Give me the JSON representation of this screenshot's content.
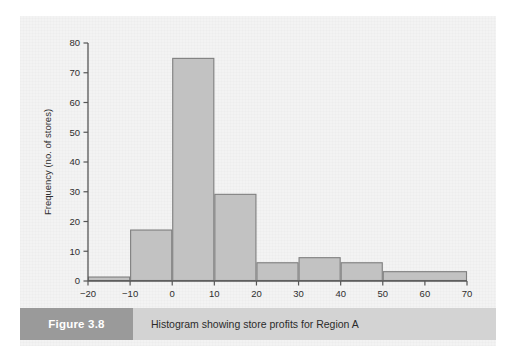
{
  "figure": {
    "tag": "Figure 3.8",
    "caption": "Histogram showing store profits for Region A"
  },
  "colors": {
    "bar_fill": "#c2c2c2",
    "bar_stroke": "#7e7e7e",
    "axis": "#555555",
    "panel_bg": "#f3f3f3",
    "caption_bar": "#d3d3d3",
    "figure_tag_bg": "#9a9a9a",
    "figure_tag_text": "#ffffff",
    "text": "#2e2e2e"
  },
  "chart_data": {
    "type": "bar",
    "title": "",
    "subtitle": "",
    "xlabel": "",
    "ylabel": "Frequency (no. of stores)",
    "xlim": [
      -20,
      70
    ],
    "ylim": [
      0,
      80
    ],
    "grid": false,
    "legend": null,
    "xticks": [
      -20,
      -10,
      0,
      10,
      20,
      30,
      40,
      50,
      60,
      70
    ],
    "xtick_labels": [
      "−20",
      "−10",
      "0",
      "10",
      "20",
      "30",
      "40",
      "50",
      "60",
      "70"
    ],
    "yticks": [
      0,
      10,
      20,
      30,
      40,
      50,
      60,
      70,
      80
    ],
    "ytick_labels": [
      "0",
      "10",
      "20",
      "30",
      "40",
      "50",
      "60",
      "70",
      "80"
    ],
    "bins": [
      {
        "left": -20,
        "right": -10,
        "value": 1.5
      },
      {
        "left": -10,
        "right": 0,
        "value": 17.3
      },
      {
        "left": 0,
        "right": 10,
        "value": 75
      },
      {
        "left": 10,
        "right": 20,
        "value": 29.3
      },
      {
        "left": 20,
        "right": 30,
        "value": 6.3
      },
      {
        "left": 30,
        "right": 40,
        "value": 8
      },
      {
        "left": 40,
        "right": 50,
        "value": 6.3
      },
      {
        "left": 50,
        "right": 70,
        "value": 3.3
      }
    ]
  }
}
